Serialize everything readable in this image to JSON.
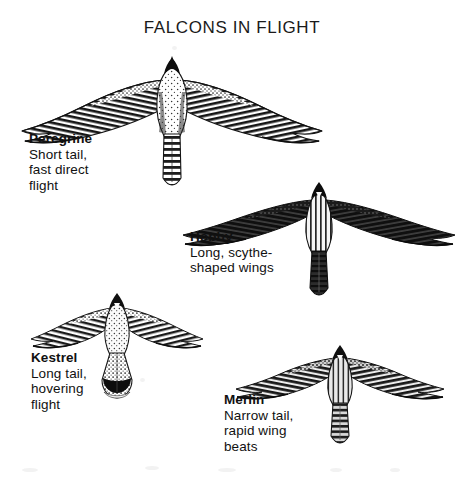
{
  "plate": {
    "title": "FALCONS IN FLIGHT",
    "background_color": "#ffffff",
    "ink_color": "#111111"
  },
  "species": [
    {
      "id": "peregrine",
      "name": "Peregrine",
      "description_lines": [
        "Short tail,",
        "fast direct",
        "flight"
      ],
      "figure_label": "peregrine-falcon-illustration",
      "silhouette": "broad-based pointed wings, short tail, heavy chest"
    },
    {
      "id": "hobby",
      "name": "Hobby",
      "description_lines": [
        "Long, scythe-",
        "shaped wings"
      ],
      "figure_label": "hobby-falcon-illustration",
      "silhouette": "long swept scythe-shaped wings, slim tail, dark plumage"
    },
    {
      "id": "kestrel",
      "name": "Kestrel",
      "description_lines": [
        "Long tail,",
        "hovering",
        "flight"
      ],
      "figure_label": "kestrel-illustration",
      "silhouette": "long fanned tail with dark terminal band, rounded wing tips"
    },
    {
      "id": "merlin",
      "name": "Merlin",
      "description_lines": [
        "Narrow tail,",
        "rapid wing",
        "beats"
      ],
      "figure_label": "merlin-illustration",
      "silhouette": "compact body, narrow tail, short pointed wings"
    }
  ]
}
